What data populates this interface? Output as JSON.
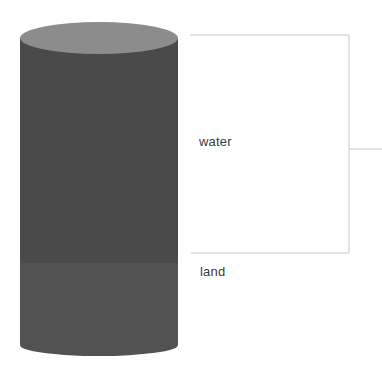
{
  "diagram": {
    "type": "cylinder-proportion",
    "segments": [
      {
        "name": "water",
        "label": "water",
        "color": "#4a4a4a",
        "y_top": 38,
        "y_bottom": 263
      },
      {
        "name": "land",
        "label": "land",
        "color": "#525252",
        "y_top": 263,
        "y_bottom": 355
      }
    ],
    "top_cap_color": "#8c8c8c",
    "bracket": {
      "target": "water",
      "color": "#c8c8c8"
    }
  },
  "colors": {
    "background": "#ffffff",
    "text": "#3a3a3a",
    "line": "#c8c8c8"
  }
}
